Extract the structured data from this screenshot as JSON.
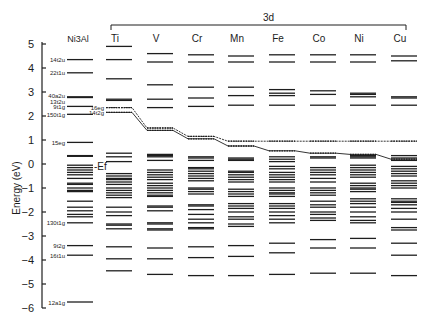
{
  "chart_data": {
    "type": "energy-level-diagram",
    "title": "",
    "group_label": "3d",
    "ylabel": "Energy (eV)",
    "ylim": [
      -6,
      5
    ],
    "yticks": [
      5,
      4,
      3,
      2,
      1,
      0,
      -1,
      -2,
      -3,
      -4,
      -5,
      -6
    ],
    "fermi_label": "-Ef",
    "columns": [
      {
        "name": "Ni3Al",
        "x": 80,
        "levels": [
          4.35,
          3.8,
          2.8,
          2.77,
          2.4,
          2.07,
          0.9,
          0.35,
          0.32,
          -0.05,
          -0.15,
          -0.25,
          -0.35,
          -0.45,
          -0.6,
          -0.8,
          -0.85,
          -1.0,
          -1.1,
          -1.15,
          -1.55,
          -1.8,
          -1.95,
          -2.1,
          -2.2,
          -2.45,
          -3.4,
          -3.8,
          -5.75
        ],
        "labels": [
          {
            "text": "14t2u",
            "e": 4.35
          },
          {
            "text": "22t1u",
            "e": 3.8
          },
          {
            "text": "40a2u",
            "e": 2.85
          },
          {
            "text": "13t2u",
            "e": 2.62
          },
          {
            "text": "9t1g",
            "e": 2.4
          },
          {
            "text": "150t1g",
            "e": 2.07
          },
          {
            "text": "15eg",
            "e": 0.9
          },
          {
            "text": "130t1g",
            "e": -2.45
          },
          {
            "text": "9t2g",
            "e": -3.4
          },
          {
            "text": "16t1u",
            "e": -3.8
          },
          {
            "text": "12a1g",
            "e": -5.75
          }
        ]
      },
      {
        "name": "Ti",
        "x": 119,
        "levels": [
          4.9,
          4.35,
          3.55,
          2.7,
          2.65,
          0.45,
          0.3,
          0.1,
          -0.4,
          -0.5,
          -0.6,
          -0.65,
          -0.75,
          -0.85,
          -1.0,
          -1.1,
          -1.2,
          -1.3,
          -1.4,
          -1.8,
          -2.0,
          -2.15,
          -2.5,
          -2.55,
          -2.7,
          -3.45,
          -3.95,
          -4.45
        ],
        "dotted_levels": [
          2.35,
          2.15
        ],
        "dotted_labels": [
          {
            "text": "16eg",
            "e": 2.35
          },
          {
            "text": "14t2g",
            "e": 2.15
          }
        ]
      },
      {
        "name": "V",
        "x": 160,
        "levels": [
          4.6,
          4.25,
          3.3,
          2.7,
          2.35,
          0.4,
          0.35,
          0.3,
          0.15,
          -0.25,
          -0.35,
          -0.45,
          -0.55,
          -0.65,
          -0.8,
          -0.9,
          -1.0,
          -1.1,
          -1.2,
          -1.3,
          -1.35,
          -1.75,
          -1.8,
          -1.95,
          -2.45,
          -2.5,
          -2.7,
          -2.75,
          -3.5,
          -3.95,
          -4.6
        ],
        "dotted_levels": [
          1.5,
          1.4
        ]
      },
      {
        "name": "Cr",
        "x": 201,
        "levels": [
          4.55,
          4.25,
          3.2,
          2.75,
          2.4,
          0.3,
          0.25,
          0.15,
          -0.15,
          -0.2,
          -0.3,
          -0.4,
          -0.5,
          -0.6,
          -0.7,
          -1.0,
          -1.05,
          -1.15,
          -1.25,
          -1.7,
          -1.75,
          -1.9,
          -2.1,
          -2.3,
          -2.45,
          -2.65,
          -2.7,
          -3.45,
          -3.9,
          -4.65
        ],
        "dotted_levels": [
          1.15,
          1.05
        ]
      },
      {
        "name": "Mn",
        "x": 241,
        "levels": [
          4.5,
          4.25,
          3.2,
          2.85,
          2.45,
          0.25,
          0.2,
          0.15,
          -0.3,
          -0.35,
          -0.45,
          -0.55,
          -0.65,
          -0.75,
          -1.05,
          -1.15,
          -1.25,
          -1.35,
          -1.65,
          -1.75,
          -1.85,
          -2.0,
          -2.2,
          -2.3,
          -2.5,
          -2.6,
          -3.4,
          -3.85,
          -4.65
        ],
        "dotted_levels": [
          0.95,
          0.75
        ]
      },
      {
        "name": "Fe",
        "x": 282,
        "levels": [
          4.55,
          4.25,
          3.1,
          2.95,
          2.85,
          2.45,
          0.3,
          0.2,
          0.1,
          -0.1,
          -0.2,
          -0.35,
          -0.45,
          -0.55,
          -0.65,
          -0.75,
          -1.0,
          -1.1,
          -1.2,
          -1.25,
          -1.35,
          -1.65,
          -1.75,
          -1.85,
          -2.0,
          -2.15,
          -2.3,
          -2.45,
          -3.3,
          -3.7,
          -4.6
        ],
        "dotted_levels": [
          0.95,
          0.55
        ]
      },
      {
        "name": "Co",
        "x": 323,
        "levels": [
          4.55,
          4.25,
          3.05,
          2.9,
          2.45,
          0.3,
          0.25,
          -0.15,
          -0.25,
          -0.35,
          -0.45,
          -0.6,
          -0.75,
          -1.0,
          -1.1,
          -1.2,
          -1.3,
          -1.55,
          -1.7,
          -1.8,
          -2.0,
          -2.1,
          -2.25,
          -2.35,
          -3.15,
          -3.5,
          -4.55
        ],
        "dotted_levels": [
          0.95,
          0.45
        ]
      },
      {
        "name": "Ni",
        "x": 363,
        "levels": [
          4.55,
          4.25,
          2.95,
          2.9,
          2.8,
          2.45,
          0.35,
          0.3,
          0.25,
          -0.05,
          -0.15,
          -0.25,
          -0.35,
          -0.45,
          -0.55,
          -0.8,
          -0.9,
          -1.0,
          -1.05,
          -1.15,
          -1.45,
          -1.55,
          -1.65,
          -1.8,
          -2.0,
          -2.2,
          -2.35,
          -2.45,
          -3.1,
          -3.5,
          -4.55
        ],
        "dotted_levels": [
          0.95,
          0.4
        ]
      },
      {
        "name": "Cu",
        "x": 404,
        "levels": [
          4.5,
          4.3,
          2.8,
          2.75,
          2.45,
          0.35,
          0.25,
          0.15,
          -0.1,
          -0.2,
          -0.3,
          -0.4,
          -0.5,
          -0.7,
          -0.8,
          -0.9,
          -1.0,
          -1.45,
          -1.55,
          -1.6,
          -1.7,
          -1.85,
          -2.0,
          -2.3,
          -2.65,
          -2.75,
          -3.3,
          -3.8,
          -4.65
        ],
        "dotted_levels": [
          0.95,
          0.2
        ]
      }
    ],
    "connectors": [
      {
        "name": "upper-dotted-trace",
        "points": [
          [
            119,
            2.35
          ],
          [
            160,
            1.5
          ],
          [
            201,
            1.15
          ],
          [
            241,
            0.95
          ],
          [
            282,
            0.95
          ],
          [
            323,
            0.95
          ],
          [
            363,
            0.95
          ],
          [
            404,
            0.95
          ]
        ]
      },
      {
        "name": "lower-solid-trace",
        "points": [
          [
            119,
            2.15
          ],
          [
            160,
            1.4
          ],
          [
            201,
            1.05
          ],
          [
            241,
            0.75
          ],
          [
            282,
            0.55
          ],
          [
            323,
            0.45
          ],
          [
            363,
            0.4
          ],
          [
            404,
            0.2
          ]
        ]
      }
    ]
  },
  "layout": {
    "zero_y": 164,
    "px_per_ev": 24,
    "axis_x": 42,
    "level_half_width": 13
  }
}
